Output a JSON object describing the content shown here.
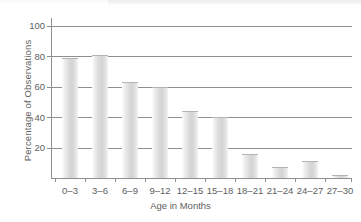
{
  "chart_data": {
    "type": "bar",
    "title": "",
    "subtitle": "",
    "xlabel": "Age in Months",
    "ylabel": "Percentage of Observations",
    "categories": [
      "0–3",
      "3–6",
      "6–9",
      "9–12",
      "12–15",
      "15–18",
      "18–21",
      "21–24",
      "24–27",
      "27–30"
    ],
    "values": [
      79,
      81,
      63,
      60,
      44,
      40,
      16,
      7,
      11,
      2
    ],
    "series": [
      {
        "name": "Percentage of Observations",
        "values": [
          79,
          81,
          63,
          60,
          44,
          40,
          16,
          7,
          11,
          2
        ]
      }
    ],
    "ylim": [
      0,
      105
    ],
    "yticks": [
      20,
      40,
      60,
      80,
      100
    ],
    "ytick_labels": [
      "20",
      "40",
      "60",
      "80",
      "100"
    ],
    "grid": true,
    "grid_axis": "y",
    "legend": false,
    "legend_position": "none",
    "bar_color": "#d8d8d8",
    "grid_color": "#8f8f8f",
    "axis_color": "#8f8f8f",
    "text_color": "#5e5e5e",
    "background": "#ffffff"
  }
}
